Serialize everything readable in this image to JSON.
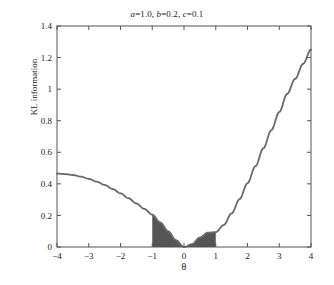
{
  "chart_data": {
    "type": "line",
    "title": "a=1.0, b=0.2, c=0.1",
    "title_parts": {
      "a_var": "a",
      "a_val": "=1.0, ",
      "b_var": "b",
      "b_val": "=0.2, ",
      "c_var": "c",
      "c_val": "=0.1"
    },
    "xlabel": "θ",
    "ylabel": "KL information",
    "xlim": [
      -4,
      4
    ],
    "ylim": [
      0,
      1.4
    ],
    "grid": false,
    "legend": null,
    "xticks": [
      -4,
      -3,
      -2,
      -1,
      0,
      1,
      2,
      3,
      4
    ],
    "xtick_labels": [
      "−4",
      "−3",
      "−2",
      "−1",
      "0",
      "1",
      "2",
      "3",
      "4"
    ],
    "yticks": [
      0,
      0.2,
      0.4,
      0.6,
      0.8,
      1,
      1.2,
      1.4
    ],
    "ytick_labels": [
      "0",
      "0.2",
      "0.4",
      "0.6",
      "0.8",
      "1",
      "1.2",
      "1.4"
    ],
    "series": [
      {
        "name": "KL information",
        "color": "#6a6a6a",
        "line_width": 1.8,
        "x": [
          -4,
          -3.75,
          -3.5,
          -3.25,
          -3,
          -2.75,
          -2.5,
          -2.25,
          -2,
          -1.75,
          -1.5,
          -1.25,
          -1,
          -0.75,
          -0.5,
          -0.25,
          0,
          0.25,
          0.5,
          0.75,
          1,
          1.25,
          1.5,
          1.75,
          2,
          2.25,
          2.5,
          2.75,
          3,
          3.25,
          3.5,
          3.75,
          4
        ],
        "y": [
          0.465,
          0.462,
          0.456,
          0.446,
          0.432,
          0.414,
          0.393,
          0.368,
          0.34,
          0.309,
          0.276,
          0.241,
          0.205,
          0.156,
          0.1,
          0.043,
          0.0,
          0.018,
          0.06,
          0.091,
          0.094,
          0.139,
          0.213,
          0.303,
          0.404,
          0.512,
          0.625,
          0.74,
          0.855,
          0.97,
          1.065,
          1.16,
          1.25
        ]
      }
    ],
    "shaded_region": {
      "name": "indifference-region",
      "x_start": -1,
      "x_end": 1,
      "fill_color": "#555555",
      "description": "filled area between curve and x-axis over theta in [-1, 1]"
    },
    "axes_style": {
      "frame_color": "#555555",
      "tick_direction": "in",
      "background": "#ffffff"
    }
  }
}
